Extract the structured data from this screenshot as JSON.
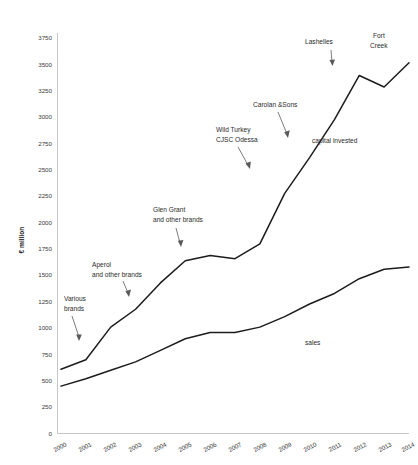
{
  "chart_data": {
    "type": "line",
    "title": "",
    "xlabel": "",
    "ylabel": "€ million",
    "ylim": [
      0,
      3750
    ],
    "xlim": [
      2000,
      2014
    ],
    "grid": false,
    "legend": "inline-labels",
    "x": [
      2000,
      2001,
      2002,
      2003,
      2004,
      2005,
      2006,
      2007,
      2008,
      2009,
      2010,
      2011,
      2012,
      2013,
      2014
    ],
    "y_ticks": [
      0,
      250,
      500,
      750,
      1000,
      1250,
      1500,
      1750,
      2000,
      2250,
      2500,
      2750,
      3000,
      3250,
      3500,
      3750
    ],
    "x_ticks": [
      2000,
      2001,
      2002,
      2003,
      2004,
      2005,
      2006,
      2007,
      2008,
      2009,
      2010,
      2011,
      2012,
      2013,
      2014
    ],
    "series": [
      {
        "name": "capital invested",
        "values": [
          610,
          700,
          1010,
          1180,
          1430,
          1640,
          1690,
          1660,
          1800,
          2280,
          2620,
          2980,
          3400,
          3290,
          3520
        ]
      },
      {
        "name": "sales",
        "values": [
          450,
          520,
          600,
          680,
          790,
          900,
          960,
          960,
          1010,
          1110,
          1230,
          1330,
          1470,
          1560,
          1580
        ]
      }
    ],
    "annotations": [
      {
        "id": "various-brands",
        "text_lines": [
          "Various",
          "brands"
        ],
        "target_year": 2001,
        "target_series": "capital invested"
      },
      {
        "id": "aperol",
        "text_lines": [
          "Aperol",
          "and other brands"
        ],
        "target_year": 2003,
        "target_series": "capital invested"
      },
      {
        "id": "glen-grant",
        "text_lines": [
          "Glen Grant",
          "and other brands"
        ],
        "target_year": 2005,
        "target_series": "capital invested"
      },
      {
        "id": "wild-turkey",
        "text_lines": [
          "Wild Turkey",
          "CJSC Odessa"
        ],
        "target_year": 2009,
        "target_series": "capital invested"
      },
      {
        "id": "carolan-sons",
        "text_lines": [
          "Carolan &Sons"
        ],
        "target_year": 2010,
        "target_series": "capital invested"
      },
      {
        "id": "lashelles",
        "text_lines": [
          "Lashelles"
        ],
        "target_year": 2012,
        "target_series": "capital invested"
      },
      {
        "id": "fort-creek",
        "text_lines": [
          "Fort",
          "Creek"
        ],
        "target_year": 2014,
        "target_series": "capital invested"
      }
    ],
    "series_labels": [
      {
        "id": "capital-invested-label",
        "text": "capital invested"
      },
      {
        "id": "sales-label",
        "text": "sales"
      }
    ]
  },
  "axis": {
    "y_title": "€ million"
  }
}
